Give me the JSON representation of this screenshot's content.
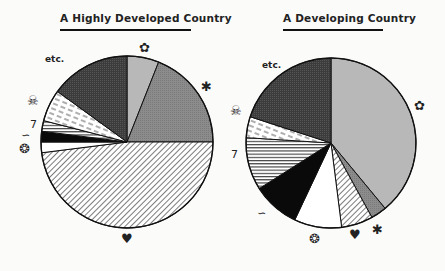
{
  "chart_data": [
    {
      "type": "pie",
      "title": "A Highly Developed Country",
      "start_angle_deg": 0,
      "direction": "clockwise",
      "slices": [
        {
          "label": "infectious disease (germ icon)",
          "icon": "germ-icon",
          "value": 6,
          "fill": "light-gray"
        },
        {
          "label": "cancer (crab icon)",
          "icon": "crab-icon",
          "value": 19,
          "fill": "medium-gray"
        },
        {
          "label": "heart disease (heart icon)",
          "icon": "heart-icon",
          "value": 48,
          "fill": "diagonal-hatch"
        },
        {
          "label": "pneumonia (swirl icon)",
          "icon": "swirl-icon",
          "value": 2,
          "fill": "white"
        },
        {
          "label": "parasites/diarrhea (worm icon)",
          "icon": "worm-icon",
          "value": 2,
          "fill": "black"
        },
        {
          "label": "infant/other (7 icon)",
          "icon": "seven-icon",
          "value": 2,
          "fill": "horizontal-stripes"
        },
        {
          "label": "accidents/poison (skull icon)",
          "icon": "skull-icon",
          "value": 6,
          "fill": "dashed-hatch"
        },
        {
          "label": "etc.",
          "icon": "",
          "value": 15,
          "fill": "dark-gray"
        }
      ]
    },
    {
      "type": "pie",
      "title": "A Developing Country",
      "start_angle_deg": 0,
      "direction": "clockwise",
      "slices": [
        {
          "label": "infectious disease (germ icon)",
          "icon": "germ-icon",
          "value": 39,
          "fill": "light-gray"
        },
        {
          "label": "cancer (crab icon)",
          "icon": "crab-icon",
          "value": 3,
          "fill": "medium-gray"
        },
        {
          "label": "heart disease (heart icon)",
          "icon": "heart-icon",
          "value": 6,
          "fill": "diagonal-hatch"
        },
        {
          "label": "pneumonia (swirl icon)",
          "icon": "swirl-icon",
          "value": 9,
          "fill": "white"
        },
        {
          "label": "parasites/diarrhea (worm icon)",
          "icon": "worm-icon",
          "value": 9,
          "fill": "black"
        },
        {
          "label": "infant/other (7 icon)",
          "icon": "seven-icon",
          "value": 10,
          "fill": "horizontal-stripes"
        },
        {
          "label": "accidents/poison (skull icon)",
          "icon": "skull-icon",
          "value": 4,
          "fill": "dashed-hatch"
        },
        {
          "label": "etc.",
          "icon": "",
          "value": 20,
          "fill": "dark-gray"
        }
      ]
    }
  ],
  "left": {
    "title": "A Highly Developed Country",
    "labels": {
      "etc": "etc.",
      "germ": "✿",
      "crab": "✱",
      "heart": "♥",
      "skull": "☠",
      "seven": "7",
      "worm": "∽",
      "swirl": "❂"
    }
  },
  "right": {
    "title": "A Developing Country",
    "labels": {
      "etc": "etc.",
      "germ": "✿",
      "crab": "✱",
      "heart": "♥",
      "skull": "☠",
      "seven": "7",
      "worm": "∽",
      "swirl": "❂"
    }
  },
  "colors": {
    "light_gray": "#b8b8b8",
    "medium_gray": "#8a8a8a",
    "dark_gray": "#3a3a3a",
    "black": "#0a0a0a",
    "background": "#fbfbfa"
  }
}
